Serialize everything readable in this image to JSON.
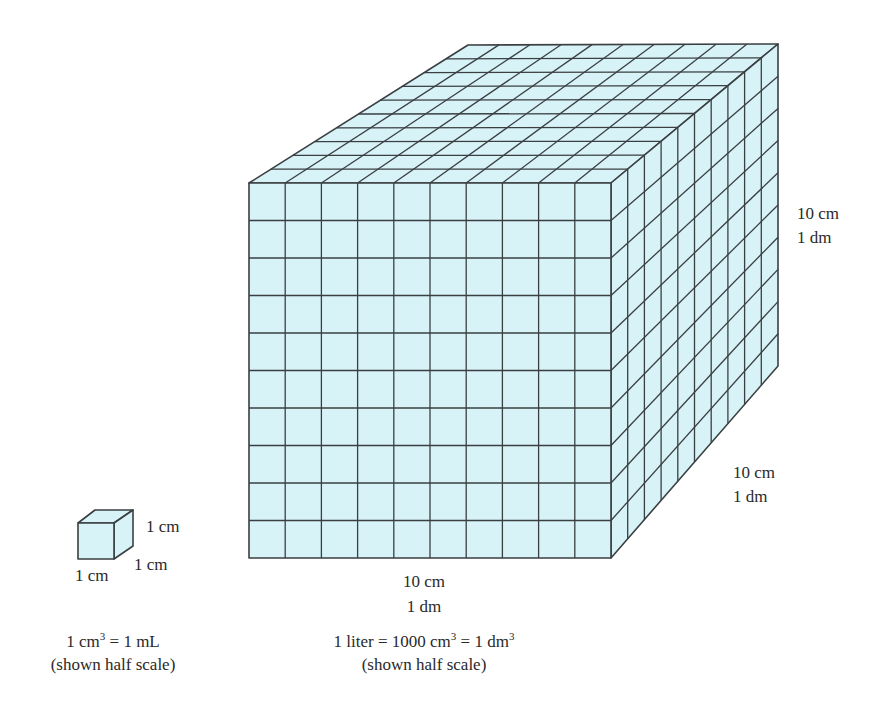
{
  "colors": {
    "fill": "#d8f3f7",
    "stroke": "#3a3f42",
    "text": "#2a2a2a"
  },
  "large_cube": {
    "divisions": 10,
    "front": [
      [
        249,
        183
      ],
      [
        611,
        183
      ],
      [
        611,
        558
      ],
      [
        249,
        558
      ]
    ],
    "back_top_left": [
      468,
      45
    ],
    "back_top_right": [
      778,
      44
    ],
    "back_bottom_right": [
      778,
      366
    ],
    "labels": {
      "width_cm": "10 cm",
      "width_dm": "1 dm",
      "height_cm": "10 cm",
      "height_dm": "1 dm",
      "depth_cm": "10 cm",
      "depth_dm": "1 dm"
    },
    "caption": {
      "prefix": "1 liter = 1000 cm",
      "exp1": "3",
      "middle": " = 1 dm",
      "exp2": "3",
      "scale_note": "(shown half scale)"
    }
  },
  "small_cube": {
    "front": [
      [
        78,
        523
      ],
      [
        114,
        523
      ],
      [
        114,
        559
      ],
      [
        78,
        559
      ]
    ],
    "back_top_left": [
      95,
      510
    ],
    "back_top_right": [
      133,
      510
    ],
    "back_bottom_right": [
      133,
      546
    ],
    "labels": {
      "width": "1 cm",
      "height": "1 cm",
      "depth": "1 cm"
    },
    "caption": {
      "prefix": "1 cm",
      "exp": "3",
      "suffix": " = 1 mL",
      "scale_note": "(shown half scale)"
    }
  }
}
